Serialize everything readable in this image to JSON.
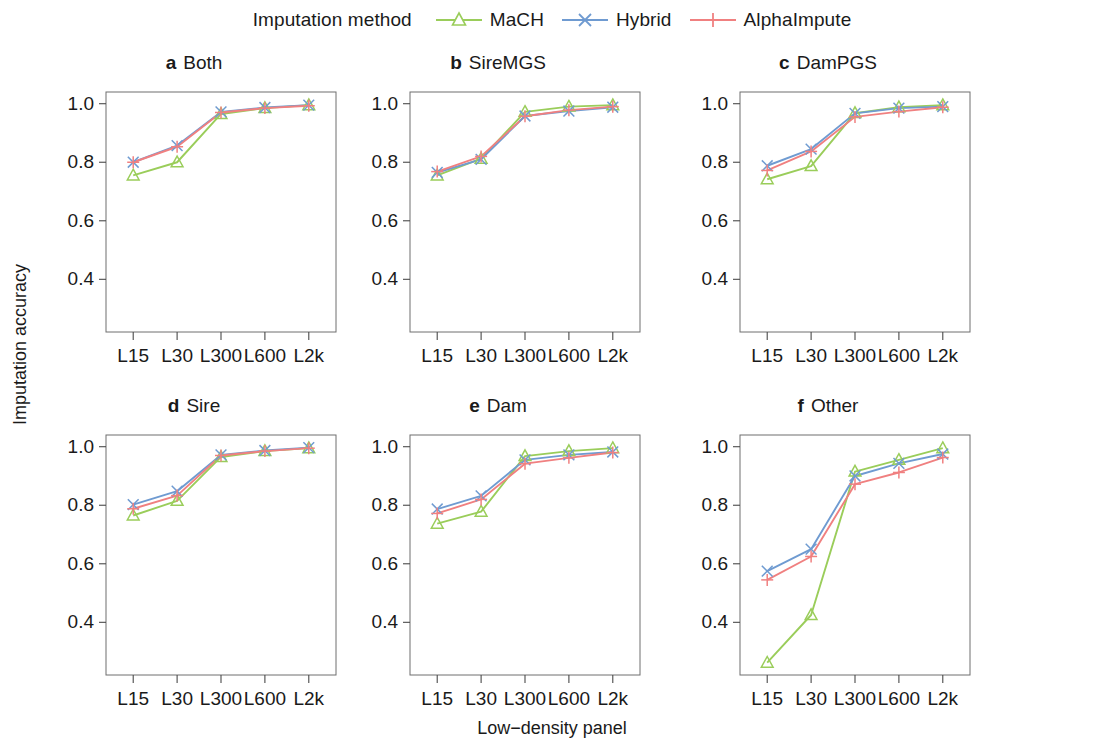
{
  "legend": {
    "title": "Imputation method",
    "entries": [
      {
        "label": "MaCH",
        "color": "#9ACD5A",
        "marker": "triangle"
      },
      {
        "label": "Hybrid",
        "color": "#6F9BD1",
        "marker": "cross-x"
      },
      {
        "label": "AlphaImpute",
        "color": "#F08080",
        "marker": "plus"
      }
    ]
  },
  "axes": {
    "xlabel": "Low−density panel",
    "ylabel": "Imputation accuracy",
    "xticks": [
      "L15",
      "L30",
      "L300",
      "L600",
      "L2k"
    ],
    "yticks": [
      "0.4",
      "0.6",
      "0.8",
      "1.0"
    ],
    "ytick_values": [
      0.4,
      0.6,
      0.8,
      1.0
    ],
    "ylim": [
      0.22,
      1.04
    ],
    "grid": false
  },
  "chart_data": [
    {
      "type": "line",
      "panel": "a",
      "title": "Both",
      "x": [
        "L15",
        "L30",
        "L300",
        "L600",
        "L2k"
      ],
      "xlabel": "Low−density panel",
      "ylabel": "Imputation accuracy",
      "ylim": [
        0.22,
        1.04
      ],
      "series": [
        {
          "name": "MaCH",
          "values": [
            0.755,
            0.8,
            0.965,
            0.985,
            0.995
          ]
        },
        {
          "name": "Hybrid",
          "values": [
            0.8,
            0.857,
            0.972,
            0.987,
            0.995
          ]
        },
        {
          "name": "AlphaImpute",
          "values": [
            0.8,
            0.853,
            0.97,
            0.985,
            0.993
          ]
        }
      ]
    },
    {
      "type": "line",
      "panel": "b",
      "title": "SireMGS",
      "x": [
        "L15",
        "L30",
        "L300",
        "L600",
        "L2k"
      ],
      "xlabel": "Low−density panel",
      "ylabel": "Imputation accuracy",
      "ylim": [
        0.22,
        1.04
      ],
      "series": [
        {
          "name": "MaCH",
          "values": [
            0.755,
            0.812,
            0.972,
            0.99,
            0.995
          ]
        },
        {
          "name": "Hybrid",
          "values": [
            0.765,
            0.81,
            0.958,
            0.975,
            0.988
          ]
        },
        {
          "name": "AlphaImpute",
          "values": [
            0.768,
            0.82,
            0.957,
            0.978,
            0.99
          ]
        }
      ]
    },
    {
      "type": "line",
      "panel": "c",
      "title": "DamPGS",
      "x": [
        "L15",
        "L30",
        "L300",
        "L600",
        "L2k"
      ],
      "xlabel": "Low−density panel",
      "ylabel": "Imputation accuracy",
      "ylim": [
        0.22,
        1.04
      ],
      "series": [
        {
          "name": "MaCH",
          "values": [
            0.742,
            0.787,
            0.968,
            0.988,
            0.995
          ]
        },
        {
          "name": "Hybrid",
          "values": [
            0.788,
            0.845,
            0.967,
            0.985,
            0.99
          ]
        },
        {
          "name": "AlphaImpute",
          "values": [
            0.772,
            0.837,
            0.955,
            0.973,
            0.988
          ]
        }
      ]
    },
    {
      "type": "line",
      "panel": "d",
      "title": "Sire",
      "x": [
        "L15",
        "L30",
        "L300",
        "L600",
        "L2k"
      ],
      "xlabel": "Low−density panel",
      "ylabel": "Imputation accuracy",
      "ylim": [
        0.22,
        1.04
      ],
      "series": [
        {
          "name": "MaCH",
          "values": [
            0.765,
            0.815,
            0.965,
            0.985,
            0.995
          ]
        },
        {
          "name": "Hybrid",
          "values": [
            0.802,
            0.848,
            0.972,
            0.987,
            0.997
          ]
        },
        {
          "name": "AlphaImpute",
          "values": [
            0.788,
            0.833,
            0.97,
            0.985,
            0.995
          ]
        }
      ]
    },
    {
      "type": "line",
      "panel": "e",
      "title": "Dam",
      "x": [
        "L15",
        "L30",
        "L300",
        "L600",
        "L2k"
      ],
      "xlabel": "Low−density panel",
      "ylabel": "Imputation accuracy",
      "ylim": [
        0.22,
        1.04
      ],
      "series": [
        {
          "name": "MaCH",
          "values": [
            0.737,
            0.778,
            0.968,
            0.985,
            0.995
          ]
        },
        {
          "name": "Hybrid",
          "values": [
            0.787,
            0.832,
            0.955,
            0.972,
            0.982
          ]
        },
        {
          "name": "AlphaImpute",
          "values": [
            0.772,
            0.82,
            0.942,
            0.962,
            0.98
          ]
        }
      ]
    },
    {
      "type": "line",
      "panel": "f",
      "title": "Other",
      "x": [
        "L15",
        "L30",
        "L300",
        "L600",
        "L2k"
      ],
      "xlabel": "Low−density panel",
      "ylabel": "Imputation accuracy",
      "ylim": [
        0.22,
        1.04
      ],
      "series": [
        {
          "name": "MaCH",
          "values": [
            0.262,
            0.425,
            0.915,
            0.955,
            0.995
          ]
        },
        {
          "name": "Hybrid",
          "values": [
            0.575,
            0.65,
            0.9,
            0.943,
            0.975
          ]
        },
        {
          "name": "AlphaImpute",
          "values": [
            0.545,
            0.625,
            0.872,
            0.912,
            0.963
          ]
        }
      ]
    }
  ]
}
